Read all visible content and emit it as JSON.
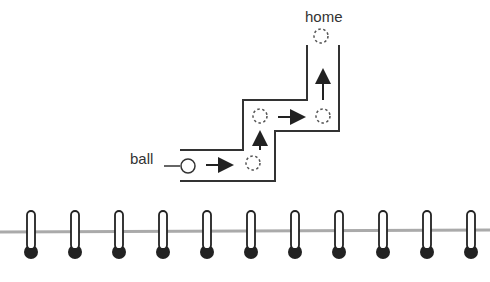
{
  "diagram": {
    "labels": {
      "home": "home",
      "ball": "ball"
    },
    "colors": {
      "stroke": "#333333",
      "dashed": "#555555",
      "binding_line": "#aaaaaa",
      "ring_fill": "#ffffff",
      "ring_dot": "#222222"
    },
    "path_description": "Ball moves right, up, right, up to reach home",
    "positions": [
      {
        "name": "ball-start",
        "style": "solid"
      },
      {
        "name": "step-1",
        "style": "dashed"
      },
      {
        "name": "step-2",
        "style": "dashed"
      },
      {
        "name": "step-3",
        "style": "dashed"
      },
      {
        "name": "home",
        "style": "dashed"
      }
    ],
    "arrows": [
      "right",
      "up",
      "right",
      "up"
    ],
    "binding_ring_count": 11
  }
}
